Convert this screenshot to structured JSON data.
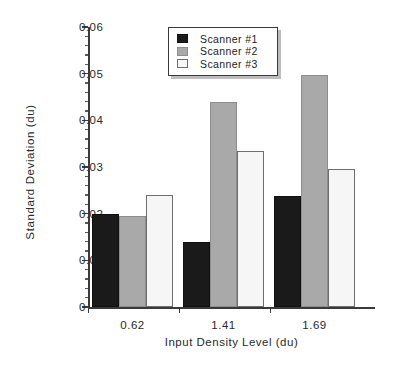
{
  "chart_data": {
    "type": "bar",
    "title": "",
    "xlabel": "Input Density Level (du)",
    "ylabel": "Standard Deviation (du)",
    "categories": [
      "0.62",
      "1.41",
      "1.69"
    ],
    "series": [
      {
        "name": "Scanner  #1",
        "values": [
          0.02,
          0.0139,
          0.0237
        ],
        "color": "#1a1a1a"
      },
      {
        "name": "Scanner  #2",
        "values": [
          0.0195,
          0.044,
          0.0498
        ],
        "color": "#a9a9a9"
      },
      {
        "name": "Scanner  #3",
        "values": [
          0.0239,
          0.0334,
          0.0296
        ],
        "color": "#f6f6f6"
      }
    ],
    "ylim": [
      0,
      0.06
    ],
    "ytick_labels": [
      "0",
      "0.01",
      "0.02",
      "0.03",
      "0.04",
      "0.05",
      "0.06"
    ],
    "ytick_values": [
      0,
      0.01,
      0.02,
      0.03,
      0.04,
      0.05,
      0.06
    ],
    "yminor_step": 0.002,
    "grid": false,
    "legend_position": "upper-center"
  },
  "legend": {
    "items": [
      {
        "label": "Scanner  #1"
      },
      {
        "label": "Scanner  #2"
      },
      {
        "label": "Scanner  #3"
      }
    ]
  }
}
